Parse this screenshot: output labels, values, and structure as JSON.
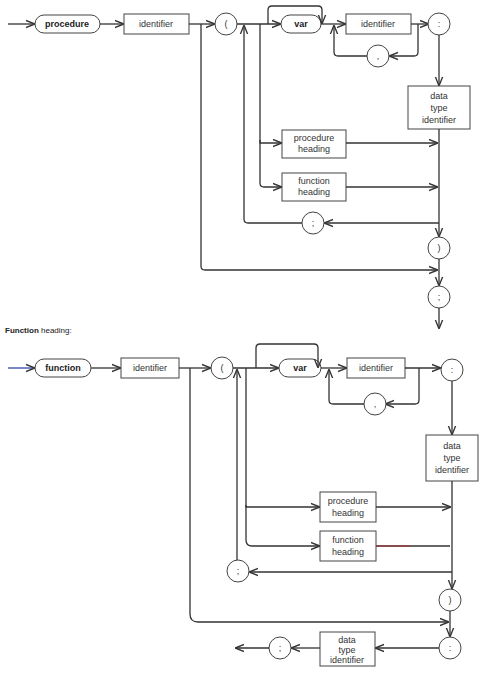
{
  "procedure_heading": {
    "keyword": "procedure",
    "identifier": "identifier",
    "open_paren": "(",
    "var_keyword": "var",
    "param_identifier": "identifier",
    "comma": ",",
    "colon": ":",
    "data_type": [
      "data",
      "type",
      "identifier"
    ],
    "procedure_heading_box": [
      "procedure",
      "heading"
    ],
    "function_heading_box": [
      "function",
      "heading"
    ],
    "semicolon_loop": ";",
    "close_paren": ")",
    "end_semicolon": ";"
  },
  "function_heading": {
    "caption_bold": "Function",
    "caption_rest": " heading:",
    "keyword": "function",
    "identifier": "identifier",
    "open_paren": "(",
    "var_keyword": "var",
    "param_identifier": "identifier",
    "comma": ",",
    "colon": ":",
    "data_type": [
      "data",
      "type",
      "identifier"
    ],
    "procedure_heading_box": [
      "procedure",
      "heading"
    ],
    "function_heading_box": [
      "function",
      "heading"
    ],
    "semicolon_loop": ";",
    "close_paren": ")",
    "result_colon": ":",
    "result_type": [
      "data",
      "type",
      "identifier"
    ],
    "end_semicolon": ";"
  }
}
